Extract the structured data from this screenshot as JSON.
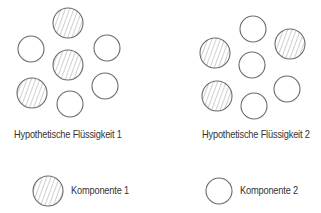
{
  "colors": {
    "stroke": "#6b6b6b",
    "hatch": "#8a8a8a",
    "text": "#333333",
    "background": "#ffffff"
  },
  "liquids": [
    {
      "label": "Hypothetische Flüssigkeit 1",
      "molecules": [
        {
          "cx": 68,
          "cy": 23,
          "r": 15,
          "component": 1
        },
        {
          "cx": 31,
          "cy": 49,
          "r": 13,
          "component": 2
        },
        {
          "cx": 107,
          "cy": 48,
          "r": 13,
          "component": 2
        },
        {
          "cx": 68,
          "cy": 65,
          "r": 15,
          "component": 1
        },
        {
          "cx": 32,
          "cy": 93,
          "r": 15,
          "component": 1
        },
        {
          "cx": 105,
          "cy": 86,
          "r": 13,
          "component": 2
        },
        {
          "cx": 70,
          "cy": 104,
          "r": 13,
          "component": 2
        }
      ]
    },
    {
      "label": "Hypothetische Flüssigkeit 2",
      "molecules": [
        {
          "cx": 253,
          "cy": 29,
          "r": 13,
          "component": 2
        },
        {
          "cx": 290,
          "cy": 44,
          "r": 15,
          "component": 1
        },
        {
          "cx": 215,
          "cy": 53,
          "r": 15,
          "component": 1
        },
        {
          "cx": 252,
          "cy": 65,
          "r": 13,
          "component": 2
        },
        {
          "cx": 217,
          "cy": 96,
          "r": 15,
          "component": 1
        },
        {
          "cx": 287,
          "cy": 89,
          "r": 13,
          "component": 2
        },
        {
          "cx": 254,
          "cy": 106,
          "r": 13,
          "component": 2
        }
      ]
    }
  ],
  "legend": [
    {
      "label": "Komponente 1",
      "style": "hatched"
    },
    {
      "label": "Komponente 2",
      "style": "open"
    }
  ]
}
